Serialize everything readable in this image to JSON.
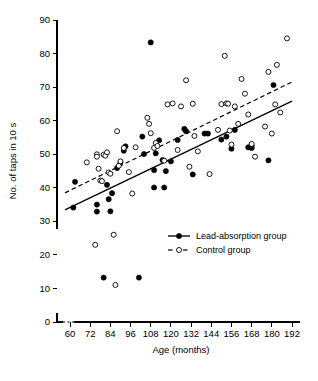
{
  "chart_data": {
    "type": "scatter",
    "title": "",
    "xlabel": "Age (months)",
    "ylabel": "No. of taps in 10 s",
    "xlim": [
      54,
      198
    ],
    "ylim": [
      0,
      90
    ],
    "y_axis_break": true,
    "y_break_note": "axis broken between 0 and 30",
    "grid": false,
    "legend_position": "center-right",
    "xticks": [
      60,
      72,
      84,
      96,
      108,
      120,
      132,
      144,
      156,
      168,
      180,
      192
    ],
    "yticks": [
      0,
      10,
      20,
      30,
      40,
      50,
      60,
      70,
      80,
      90
    ],
    "xtick_labels": [
      "60",
      "72",
      "84",
      "96",
      "108",
      "120",
      "132",
      "144",
      "156",
      "168",
      "180",
      "192"
    ],
    "ytick_labels": [
      "0",
      "10",
      "20",
      "30",
      "40",
      "50",
      "60",
      "70",
      "80",
      "90"
    ],
    "series": [
      {
        "name": "Lead-absorption group",
        "marker": "filled-circle",
        "color": "#000000",
        "line_style": "solid",
        "trend_line": {
          "x1": 57,
          "y1": 33.3,
          "x2": 192,
          "y2": 65.8
        },
        "points": [
          [
            62,
            34.0
          ],
          [
            63,
            41.7
          ],
          [
            76,
            34.9
          ],
          [
            76,
            32.8
          ],
          [
            80,
            13.1
          ],
          [
            82,
            40.8
          ],
          [
            83,
            36.5
          ],
          [
            84,
            32.9
          ],
          [
            85,
            38.3
          ],
          [
            88,
            45.8
          ],
          [
            90,
            47.5
          ],
          [
            92,
            51.0
          ],
          [
            93,
            52.3
          ],
          [
            101,
            13.1
          ],
          [
            103,
            55.2
          ],
          [
            104,
            50.0
          ],
          [
            108,
            83.3
          ],
          [
            110,
            45.2
          ],
          [
            110,
            40.0
          ],
          [
            111,
            50.2
          ],
          [
            113,
            54.1
          ],
          [
            115,
            48.2
          ],
          [
            116,
            40.0
          ],
          [
            117,
            44.9
          ],
          [
            120,
            47.8
          ],
          [
            124,
            54.2
          ],
          [
            128,
            57.5
          ],
          [
            129,
            56.8
          ],
          [
            133,
            43.9
          ],
          [
            140,
            56.1
          ],
          [
            142,
            56.1
          ],
          [
            150,
            54.3
          ],
          [
            153,
            55.2
          ],
          [
            156,
            51.6
          ],
          [
            158,
            57.2
          ],
          [
            166,
            52.0
          ],
          [
            168,
            52.4
          ],
          [
            168,
            51.8
          ],
          [
            178,
            48.1
          ],
          [
            181,
            70.6
          ]
        ]
      },
      {
        "name": "Control group",
        "marker": "open-circle",
        "color": "#000000",
        "line_style": "dashed",
        "trend_line": {
          "x1": 57,
          "y1": 38.4,
          "x2": 192,
          "y2": 71.5
        },
        "points": [
          [
            70,
            47.5
          ],
          [
            75,
            22.9
          ],
          [
            76,
            49.9
          ],
          [
            76,
            49.2
          ],
          [
            77,
            45.6
          ],
          [
            78,
            42.1
          ],
          [
            79,
            41.9
          ],
          [
            80,
            49.8
          ],
          [
            81,
            49.5
          ],
          [
            82,
            50.5
          ],
          [
            83,
            44.5
          ],
          [
            84,
            44.1
          ],
          [
            86,
            25.9
          ],
          [
            87,
            10.9
          ],
          [
            88,
            56.8
          ],
          [
            89,
            46.5
          ],
          [
            90,
            47.8
          ],
          [
            92,
            51.8
          ],
          [
            95,
            44.6
          ],
          [
            97,
            38.2
          ],
          [
            99,
            52.0
          ],
          [
            106,
            60.8
          ],
          [
            107,
            59.0
          ],
          [
            108,
            56.2
          ],
          [
            110,
            51.8
          ],
          [
            111,
            53.3
          ],
          [
            112,
            52.4
          ],
          [
            116,
            48.0
          ],
          [
            118,
            64.8
          ],
          [
            121,
            65.1
          ],
          [
            124,
            51.2
          ],
          [
            126,
            64.2
          ],
          [
            129,
            72.0
          ],
          [
            131,
            46.2
          ],
          [
            133,
            65.0
          ],
          [
            134,
            55.4
          ],
          [
            136,
            50.8
          ],
          [
            143,
            44.0
          ],
          [
            148,
            57.2
          ],
          [
            150,
            64.9
          ],
          [
            152,
            79.3
          ],
          [
            153,
            65.1
          ],
          [
            154,
            65.0
          ],
          [
            155,
            57.0
          ],
          [
            156,
            52.8
          ],
          [
            158,
            64.2
          ],
          [
            160,
            59.0
          ],
          [
            162,
            72.4
          ],
          [
            164,
            68.0
          ],
          [
            166,
            61.8
          ],
          [
            168,
            53.0
          ],
          [
            170,
            49.2
          ],
          [
            176,
            58.2
          ],
          [
            178,
            74.5
          ],
          [
            180,
            56.1
          ],
          [
            182,
            64.8
          ],
          [
            183,
            76.6
          ],
          [
            185,
            62.4
          ],
          [
            189,
            84.5
          ]
        ]
      }
    ],
    "annotations": []
  },
  "legend": {
    "items": [
      {
        "label": "Lead-absorption group",
        "marker": "filled-circle",
        "line": "solid"
      },
      {
        "label": "Control group",
        "marker": "open-circle",
        "line": "dashed"
      }
    ]
  }
}
